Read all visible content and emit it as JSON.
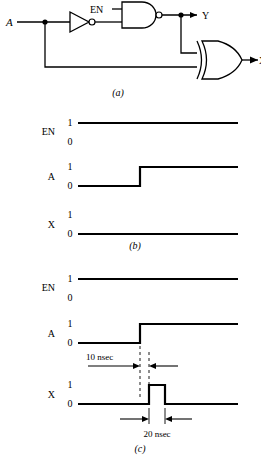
{
  "figure": {
    "title_caption_a": "(a)",
    "title_caption_b": "(b)",
    "title_caption_c": "(c)",
    "background_color": "#ffffff",
    "line_color": "#000000"
  },
  "circuit": {
    "caption": "(a)",
    "inputs": [
      {
        "name": "A",
        "label": "A"
      },
      {
        "name": "EN",
        "label": "EN"
      }
    ],
    "outputs": [
      {
        "name": "Y",
        "label": "Y"
      },
      {
        "name": "X",
        "label": "X"
      }
    ],
    "gates": [
      {
        "name": "inverter",
        "type": "NOT",
        "has_bubble": true
      },
      {
        "name": "nand",
        "type": "NAND",
        "has_bubble": true,
        "inputs": 2
      },
      {
        "name": "xor",
        "type": "XOR",
        "has_bubble": false,
        "inputs": 2
      }
    ],
    "junction_dots": 2
  },
  "timing_b": {
    "caption": "(b)",
    "signals": [
      {
        "name": "EN",
        "label": "EN",
        "high_label": "1",
        "low_label": "0",
        "waveform": "constant-high"
      },
      {
        "name": "A",
        "label": "A",
        "high_label": "1",
        "low_label": "0",
        "waveform": "rising-edge"
      },
      {
        "name": "X",
        "label": "X",
        "high_label": "1",
        "low_label": "0",
        "waveform": "constant-low"
      }
    ]
  },
  "timing_c": {
    "caption": "(c)",
    "signals": [
      {
        "name": "EN",
        "label": "EN",
        "high_label": "1",
        "low_label": "0",
        "waveform": "constant-high"
      },
      {
        "name": "A",
        "label": "A",
        "high_label": "1",
        "low_label": "0",
        "waveform": "rising-edge"
      },
      {
        "name": "X",
        "label": "X",
        "high_label": "1",
        "low_label": "0",
        "waveform": "glitch-pulse"
      }
    ],
    "annotations": [
      {
        "name": "delay-10nsec",
        "label": "10 nsec",
        "value": 10,
        "unit": "nsec"
      },
      {
        "name": "pulse-width-20nsec",
        "label": "20 nsec",
        "value": 20,
        "unit": "nsec"
      }
    ]
  }
}
